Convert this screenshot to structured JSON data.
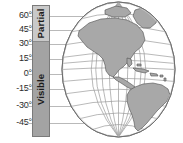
{
  "figure": {
    "name": "earth-visibility-latitude-diagram",
    "background_color": "#ffffff"
  },
  "axis": {
    "name": "latitude-axis",
    "unit": "degrees",
    "ticks": [
      {
        "label": "60°",
        "value": 60,
        "y": 16
      },
      {
        "label": "45°",
        "value": 45,
        "y": 30
      },
      {
        "label": "30°",
        "value": 30,
        "y": 44
      },
      {
        "label": "15°",
        "value": 15,
        "y": 59
      },
      {
        "label": "0°",
        "value": 0,
        "y": 74
      },
      {
        "label": "-15°",
        "value": -15,
        "y": 89
      },
      {
        "label": "-30°",
        "value": -30,
        "y": 106
      },
      {
        "label": "-45°",
        "value": -45,
        "y": 123
      }
    ],
    "line_color": "#b9b9b9",
    "text_color": "#2b2b2b"
  },
  "visibility_bar": {
    "name": "visibility-bar",
    "border_color": "#7a7a7a",
    "segments": [
      {
        "key": "partial",
        "label": "Partial",
        "color": "#c9c9c9",
        "latitude_range": [
          30,
          60
        ]
      },
      {
        "key": "visible",
        "label": "Visible",
        "color": "#a3a3a3",
        "latitude_range": [
          -45,
          30
        ]
      }
    ]
  },
  "globe": {
    "name": "earth-globe",
    "view": "Americas / Western Hemisphere",
    "ocean_color": "#ffffff",
    "land_color": "#a8a8a8",
    "land_stroke": "#4f4f4f",
    "graticule_color": "#9b9b9b",
    "outline_color": "#6e6e6e",
    "graticule": {
      "parallel_step_deg": 15,
      "meridian_step_deg": 15
    },
    "landmasses": [
      "North America",
      "Greenland",
      "Central America",
      "Caribbean Islands",
      "South America"
    ]
  }
}
